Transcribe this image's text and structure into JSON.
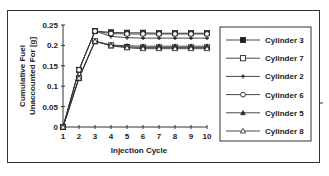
{
  "chart_data": {
    "type": "line",
    "title": "",
    "xlabel": "Injection Cycle",
    "ylabel": "Cumulative Fuel Unaccounted For [g]",
    "ylabel_lines": [
      "Cumulative Fuel",
      "Unaccounted For  [g]"
    ],
    "x": [
      1,
      2,
      3,
      4,
      5,
      6,
      7,
      8,
      9,
      10
    ],
    "x_ticks": [
      "1",
      "2",
      "3",
      "4",
      "5",
      "6",
      "7",
      "8",
      "9",
      "10"
    ],
    "y_ticks": [
      "0",
      "0.05",
      "0.1",
      "0.15",
      "0.2",
      "0.25"
    ],
    "ylim": [
      0,
      0.25
    ],
    "xlim": [
      1,
      10
    ],
    "grid": false,
    "legend_position": "right",
    "series": [
      {
        "name": "Cylinder 3",
        "marker": "filled-square",
        "values": [
          0,
          0.14,
          0.235,
          0.232,
          0.231,
          0.231,
          0.23,
          0.23,
          0.23,
          0.23
        ]
      },
      {
        "name": "Cylinder 7",
        "marker": "open-square",
        "values": [
          0,
          0.12,
          0.21,
          0.2,
          0.196,
          0.195,
          0.195,
          0.195,
          0.195,
          0.195
        ]
      },
      {
        "name": "Cylinder 2",
        "marker": "plus",
        "values": [
          0,
          0.14,
          0.235,
          0.222,
          0.219,
          0.218,
          0.218,
          0.218,
          0.218,
          0.218
        ]
      },
      {
        "name": "Cylinder 6",
        "marker": "open-circle",
        "values": [
          0,
          0.14,
          0.235,
          0.229,
          0.228,
          0.228,
          0.228,
          0.228,
          0.228,
          0.228
        ]
      },
      {
        "name": "Cylinder 5",
        "marker": "filled-triangle",
        "values": [
          0,
          0.12,
          0.21,
          0.201,
          0.199,
          0.198,
          0.198,
          0.198,
          0.198,
          0.198
        ]
      },
      {
        "name": "Cylinder 8",
        "marker": "open-triangle",
        "values": [
          0,
          0.12,
          0.21,
          0.199,
          0.194,
          0.192,
          0.192,
          0.192,
          0.192,
          0.192
        ]
      }
    ]
  }
}
